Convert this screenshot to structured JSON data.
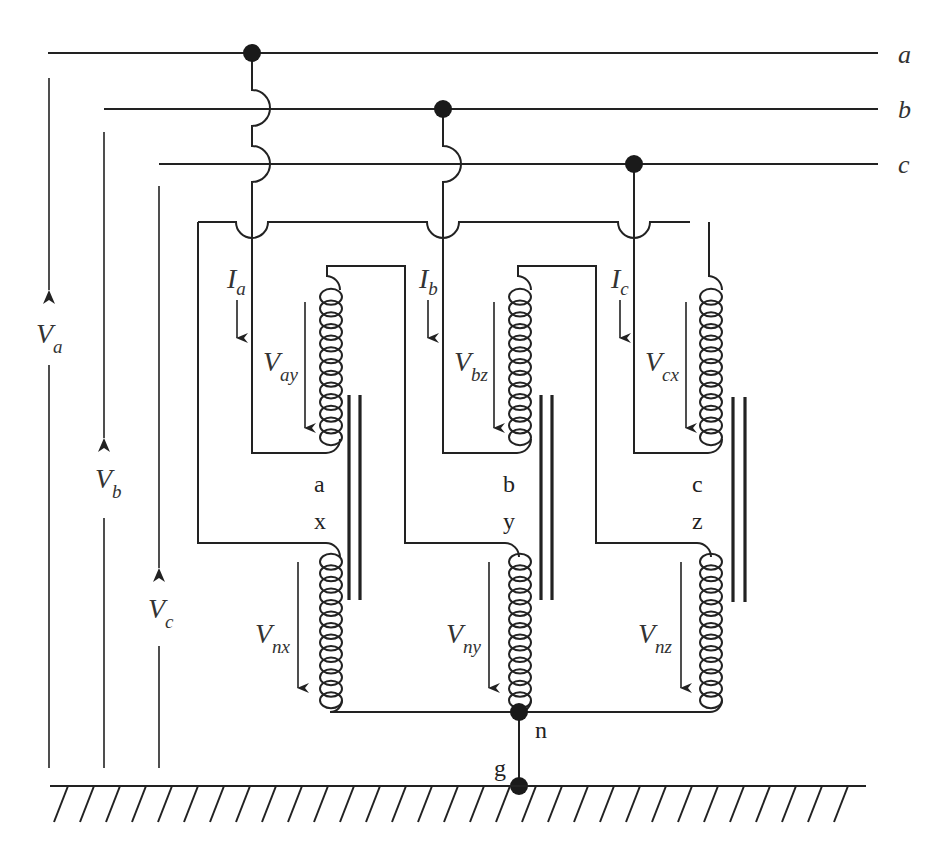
{
  "diagram": {
    "type": "three-phase transformer winding schematic (zigzag / interconnected star) with grounded neutral",
    "colors": {
      "line": "#222222",
      "background": "#ffffff",
      "label": "#333333"
    },
    "bus_lines": [
      {
        "id": "a",
        "label": "a"
      },
      {
        "id": "b",
        "label": "b"
      },
      {
        "id": "c",
        "label": "c"
      }
    ],
    "phase_voltages": [
      {
        "id": "Va",
        "main": "V",
        "sub": "a"
      },
      {
        "id": "Vb",
        "main": "V",
        "sub": "b"
      },
      {
        "id": "Vc",
        "main": "V",
        "sub": "c"
      }
    ],
    "currents": [
      {
        "id": "Ia",
        "main": "I",
        "sub": "a"
      },
      {
        "id": "Ib",
        "main": "I",
        "sub": "b"
      },
      {
        "id": "Ic",
        "main": "I",
        "sub": "c"
      }
    ],
    "upper_winding_voltages": [
      {
        "id": "Vay",
        "main": "V",
        "sub": "ay"
      },
      {
        "id": "Vbz",
        "main": "V",
        "sub": "bz"
      },
      {
        "id": "Vcx",
        "main": "V",
        "sub": "cx"
      }
    ],
    "lower_winding_voltages": [
      {
        "id": "Vnx",
        "main": "V",
        "sub": "nx"
      },
      {
        "id": "Vny",
        "main": "V",
        "sub": "ny"
      },
      {
        "id": "Vnz",
        "main": "V",
        "sub": "nz"
      }
    ],
    "terminal_labels": {
      "upper": [
        "a",
        "b",
        "c"
      ],
      "lower": [
        "x",
        "y",
        "z"
      ]
    },
    "neutral_label": "n",
    "ground_label": "g"
  }
}
